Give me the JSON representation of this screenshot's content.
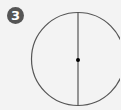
{
  "figure": {
    "step_number": "3",
    "shape": "circle",
    "elements": [
      "circle-outline",
      "vertical-diameter",
      "center-point"
    ],
    "colors": {
      "background": "#f3f3f3",
      "stroke": "#555555",
      "badge": "#555555",
      "center_dot": "#000000"
    }
  }
}
